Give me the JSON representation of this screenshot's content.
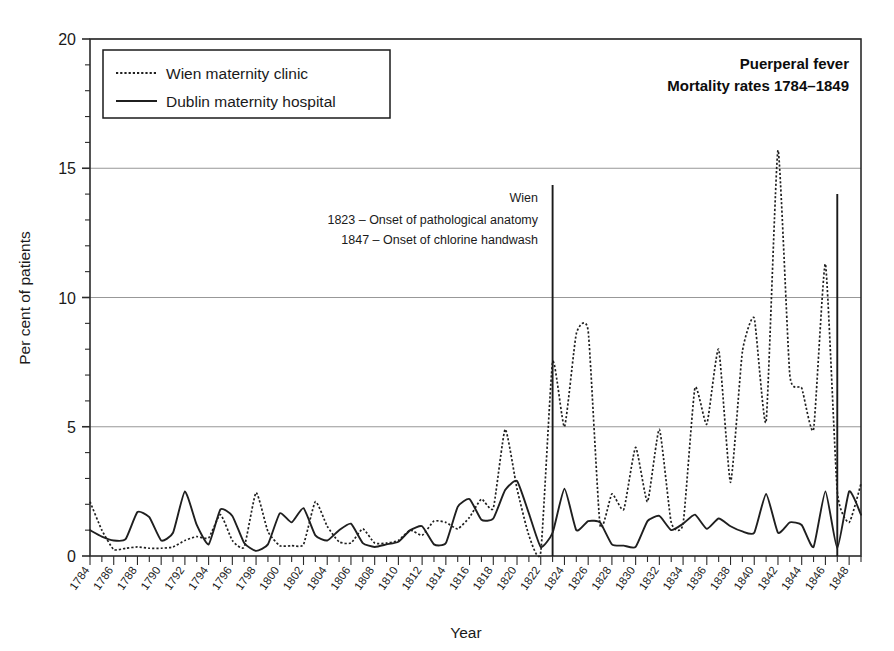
{
  "chart_data": {
    "type": "line",
    "title": "Puerperal fever",
    "subtitle": "Mortality rates 1784–1849",
    "xlabel": "Year",
    "ylabel": "Per cent of patients",
    "ylim": [
      0,
      20
    ],
    "xlim": [
      1784,
      1849
    ],
    "yticks": [
      0,
      5,
      10,
      15,
      20
    ],
    "ytick_labels": [
      "0",
      "5",
      "10",
      "15",
      "20"
    ],
    "y_minor_step": 1,
    "grid": "horizontal-major",
    "legend_position": "top-left",
    "xticks": [
      1784,
      1785,
      1786,
      1787,
      1788,
      1789,
      1790,
      1791,
      1792,
      1793,
      1794,
      1795,
      1796,
      1797,
      1798,
      1799,
      1800,
      1801,
      1802,
      1803,
      1804,
      1805,
      1806,
      1807,
      1808,
      1809,
      1810,
      1811,
      1812,
      1813,
      1814,
      1815,
      1816,
      1817,
      1818,
      1819,
      1820,
      1821,
      1822,
      1823,
      1824,
      1825,
      1826,
      1827,
      1828,
      1829,
      1830,
      1831,
      1832,
      1833,
      1834,
      1835,
      1836,
      1837,
      1838,
      1839,
      1840,
      1841,
      1842,
      1843,
      1844,
      1845,
      1846,
      1847,
      1848,
      1849
    ],
    "xtick_labels": [
      "1784",
      "1786",
      "1788",
      "1790",
      "1792",
      "1794",
      "1796",
      "1798",
      "1800",
      "1802",
      "1804",
      "1806",
      "1808",
      "1810",
      "1812",
      "1814",
      "1816",
      "1818",
      "1820",
      "1822",
      "1824",
      "1826",
      "1828",
      "1830",
      "1832",
      "1834",
      "1836",
      "1838",
      "1840",
      "1842",
      "1844",
      "1846",
      "1848"
    ],
    "xtick_label_years": [
      1784,
      1786,
      1788,
      1790,
      1792,
      1794,
      1796,
      1798,
      1800,
      1802,
      1804,
      1806,
      1808,
      1810,
      1812,
      1814,
      1816,
      1818,
      1820,
      1822,
      1824,
      1826,
      1828,
      1830,
      1832,
      1834,
      1836,
      1838,
      1840,
      1842,
      1844,
      1846,
      1848
    ],
    "x": [
      1784,
      1785,
      1786,
      1787,
      1788,
      1789,
      1790,
      1791,
      1792,
      1793,
      1794,
      1795,
      1796,
      1797,
      1798,
      1799,
      1800,
      1801,
      1802,
      1803,
      1804,
      1805,
      1806,
      1807,
      1808,
      1809,
      1810,
      1811,
      1812,
      1813,
      1814,
      1815,
      1816,
      1817,
      1818,
      1819,
      1820,
      1821,
      1822,
      1823,
      1824,
      1825,
      1826,
      1827,
      1828,
      1829,
      1830,
      1831,
      1832,
      1833,
      1834,
      1835,
      1836,
      1837,
      1838,
      1839,
      1840,
      1841,
      1842,
      1843,
      1844,
      1845,
      1846,
      1847,
      1848,
      1849
    ],
    "series": [
      {
        "name": "Wien maternity clinic",
        "style": "dotted",
        "values": [
          2.1,
          1.0,
          0.25,
          0.3,
          0.35,
          0.3,
          0.3,
          0.35,
          0.6,
          0.75,
          0.7,
          1.6,
          0.6,
          0.35,
          2.45,
          0.95,
          0.4,
          0.4,
          0.45,
          2.1,
          1.15,
          0.55,
          0.5,
          1.05,
          0.5,
          0.5,
          0.6,
          1.0,
          0.8,
          1.35,
          1.3,
          1.05,
          1.5,
          2.2,
          1.85,
          4.9,
          2.6,
          0.8,
          0.15,
          7.5,
          5.0,
          8.6,
          8.7,
          1.2,
          2.4,
          1.8,
          4.2,
          2.1,
          4.9,
          1.3,
          1.25,
          6.5,
          5.1,
          8.0,
          2.85,
          7.9,
          9.2,
          5.2,
          15.7,
          7.0,
          6.5,
          4.9,
          11.3,
          2.5,
          1.3,
          2.8
        ]
      },
      {
        "name": "Dublin maternity hospital",
        "style": "solid",
        "values": [
          1.0,
          0.75,
          0.6,
          0.65,
          1.7,
          1.5,
          0.6,
          0.9,
          2.5,
          1.2,
          0.45,
          1.8,
          1.55,
          0.5,
          0.2,
          0.45,
          1.65,
          1.3,
          1.85,
          0.8,
          0.6,
          1.0,
          1.25,
          0.5,
          0.35,
          0.45,
          0.55,
          1.0,
          1.15,
          0.45,
          0.5,
          1.9,
          2.2,
          1.4,
          1.45,
          2.55,
          2.9,
          1.65,
          0.35,
          0.9,
          2.6,
          1.0,
          1.35,
          1.3,
          0.45,
          0.4,
          0.35,
          1.35,
          1.55,
          1.0,
          1.25,
          1.6,
          1.05,
          1.45,
          1.15,
          0.95,
          0.9,
          2.4,
          0.9,
          1.3,
          1.2,
          0.35,
          2.5,
          0.3,
          2.5,
          1.6
        ]
      }
    ],
    "event_lines": [
      {
        "name": "onset-pathological-anatomy",
        "year": 1823,
        "top_value": 14.35,
        "bottom_value": 0
      },
      {
        "name": "onset-chlorine-handwash",
        "year": 1847,
        "top_value": 14.0,
        "bottom_value": 0
      }
    ]
  },
  "legend": {
    "items": [
      {
        "label": "Wien maternity clinic",
        "style": "dotted"
      },
      {
        "label": "Dublin maternity hospital",
        "style": "solid"
      }
    ]
  },
  "title": {
    "line1": "Puerperal fever",
    "line2": "Mortality rates 1784–1849"
  },
  "annotation": {
    "line1": "Wien",
    "line2": "1823 – Onset of pathological anatomy",
    "line3": "1847 – Onset of chlorine handwash"
  },
  "axes": {
    "ylabel": "Per cent of patients",
    "xlabel": "Year"
  },
  "colors": {
    "ink": "#1f1f1f",
    "grid": "#8c8c8c",
    "background": "#ffffff"
  }
}
